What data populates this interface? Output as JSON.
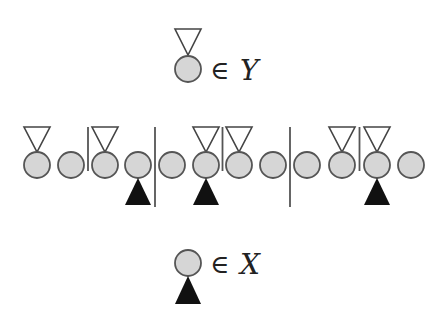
{
  "colors": {
    "node_fill": "#d6d6d6",
    "node_stroke": "#555555",
    "marker_y_fill": "#ffffff",
    "marker_y_stroke": "#444444",
    "marker_x_fill": "#111111",
    "separator": "#555555"
  },
  "legend_top": {
    "marker": "open-down-triangle",
    "symbol": "∈",
    "set": "Y"
  },
  "legend_bottom": {
    "marker": "filled-up-triangle",
    "symbol": "∈",
    "set": "X"
  },
  "sequence": {
    "nodes": [
      {
        "index": 1,
        "in_Y": true,
        "in_X": false
      },
      {
        "index": 2,
        "in_Y": false,
        "in_X": false
      },
      {
        "index": 3,
        "in_Y": true,
        "in_X": false
      },
      {
        "index": 4,
        "in_Y": false,
        "in_X": true
      },
      {
        "index": 5,
        "in_Y": false,
        "in_X": false
      },
      {
        "index": 6,
        "in_Y": true,
        "in_X": true
      },
      {
        "index": 7,
        "in_Y": true,
        "in_X": false
      },
      {
        "index": 8,
        "in_Y": false,
        "in_X": false
      },
      {
        "index": 9,
        "in_Y": false,
        "in_X": false
      },
      {
        "index": 10,
        "in_Y": true,
        "in_X": false
      },
      {
        "index": 11,
        "in_Y": true,
        "in_X": true
      },
      {
        "index": 12,
        "in_Y": false,
        "in_X": false
      }
    ],
    "separators": [
      {
        "after_node": 2,
        "length": "short"
      },
      {
        "after_node": 4,
        "length": "long"
      },
      {
        "after_node": 6,
        "length": "short"
      },
      {
        "after_node": 8,
        "length": "long"
      },
      {
        "after_node": 10,
        "length": "short"
      }
    ]
  }
}
